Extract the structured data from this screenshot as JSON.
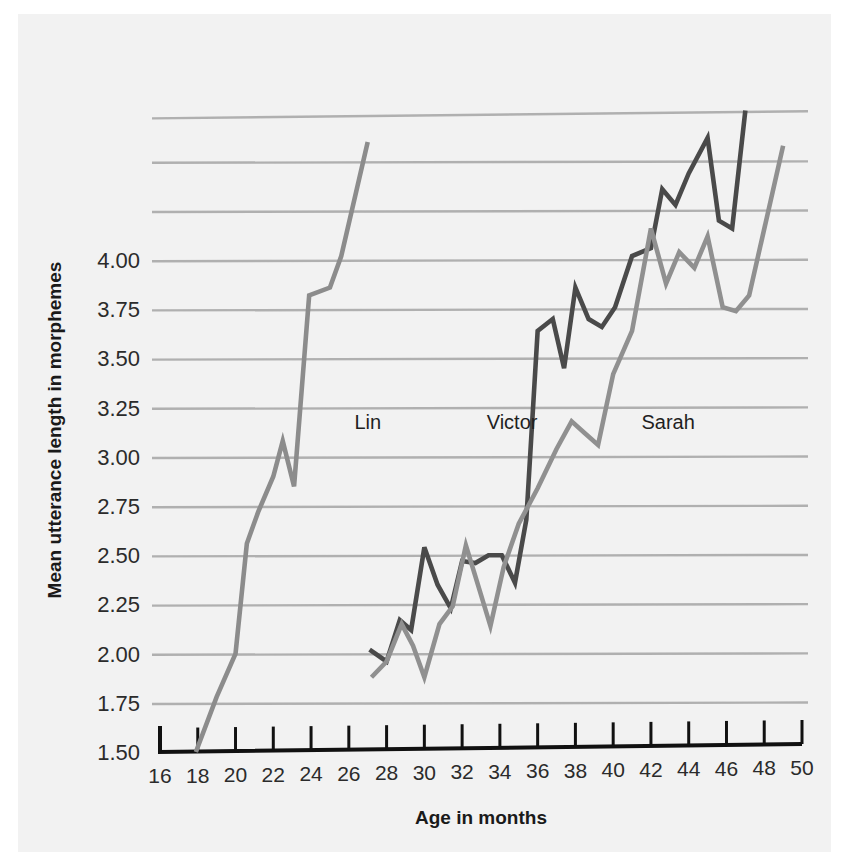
{
  "figure": {
    "background_color": "#f2f2f2",
    "page_color": "#ffffff"
  },
  "chart_data": {
    "type": "line",
    "title": "",
    "xlabel": "Age in months",
    "ylabel": "Mean utterance length in morphemes",
    "xlim": [
      16,
      50
    ],
    "ylim": [
      1.5,
      4.75
    ],
    "xticks": [
      16,
      18,
      20,
      22,
      24,
      26,
      28,
      30,
      32,
      34,
      36,
      38,
      40,
      42,
      44,
      46,
      48,
      50
    ],
    "xtick_labels": [
      "16",
      "18",
      "20",
      "22",
      "24",
      "26",
      "28",
      "30",
      "32",
      "34",
      "36",
      "38",
      "40",
      "42",
      "44",
      "46",
      "48",
      "50"
    ],
    "yticks": [
      1.5,
      1.75,
      2.0,
      2.25,
      2.5,
      2.75,
      3.0,
      3.25,
      3.5,
      3.75,
      4.0
    ],
    "ytick_labels": [
      "1.50",
      "1.75",
      "2.00",
      "2.25",
      "2.50",
      "2.75",
      "3.00",
      "3.25",
      "3.50",
      "3.75",
      "4.00"
    ],
    "grid": true,
    "grid_axis": "y",
    "grid_values": [
      1.75,
      2.0,
      2.25,
      2.5,
      2.75,
      3.0,
      3.25,
      3.5,
      3.75,
      4.0,
      4.25,
      4.5,
      4.75
    ],
    "legend": "inline-labels",
    "series": [
      {
        "name": "Lin",
        "color": "#8c8c8c",
        "label_x": 26.3,
        "label_y": 3.14,
        "points": [
          [
            17.9,
            1.5
          ],
          [
            19.0,
            1.78
          ],
          [
            20.0,
            2.0
          ],
          [
            20.6,
            2.56
          ],
          [
            21.2,
            2.72
          ],
          [
            22.0,
            2.9
          ],
          [
            22.5,
            3.08
          ],
          [
            23.1,
            2.85
          ],
          [
            23.9,
            3.82
          ],
          [
            25.0,
            3.86
          ],
          [
            25.6,
            4.02
          ],
          [
            27.0,
            4.6
          ]
        ]
      },
      {
        "name": "Victor",
        "color": "#4a4a4a",
        "label_x": 33.3,
        "label_y": 3.14,
        "points": [
          [
            27.1,
            2.02
          ],
          [
            28.0,
            1.96
          ],
          [
            28.7,
            2.17
          ],
          [
            29.3,
            2.12
          ],
          [
            30.0,
            2.54
          ],
          [
            30.7,
            2.35
          ],
          [
            31.4,
            2.23
          ],
          [
            32.0,
            2.47
          ],
          [
            32.7,
            2.46
          ],
          [
            33.4,
            2.5
          ],
          [
            34.1,
            2.5
          ],
          [
            34.8,
            2.36
          ],
          [
            35.4,
            2.68
          ],
          [
            36.0,
            3.64
          ],
          [
            36.8,
            3.7
          ],
          [
            37.4,
            3.45
          ],
          [
            38.0,
            3.86
          ],
          [
            38.7,
            3.7
          ],
          [
            39.4,
            3.66
          ],
          [
            40.1,
            3.76
          ],
          [
            41.0,
            4.02
          ],
          [
            42.0,
            4.06
          ],
          [
            42.6,
            4.36
          ],
          [
            43.3,
            4.28
          ],
          [
            44.0,
            4.44
          ],
          [
            45.0,
            4.62
          ],
          [
            45.6,
            4.2
          ],
          [
            46.3,
            4.16
          ],
          [
            47.0,
            4.76
          ]
        ]
      },
      {
        "name": "Sarah",
        "color": "#909090",
        "label_x": 41.5,
        "label_y": 3.14,
        "points": [
          [
            27.2,
            1.88
          ],
          [
            28.0,
            1.96
          ],
          [
            28.8,
            2.15
          ],
          [
            29.4,
            2.04
          ],
          [
            30.0,
            1.88
          ],
          [
            30.8,
            2.15
          ],
          [
            31.5,
            2.24
          ],
          [
            32.2,
            2.55
          ],
          [
            32.9,
            2.33
          ],
          [
            33.5,
            2.14
          ],
          [
            34.2,
            2.44
          ],
          [
            35.0,
            2.66
          ],
          [
            36.0,
            2.84
          ],
          [
            37.0,
            3.04
          ],
          [
            37.8,
            3.18
          ],
          [
            38.5,
            3.12
          ],
          [
            39.2,
            3.06
          ],
          [
            40.0,
            3.42
          ],
          [
            41.0,
            3.64
          ],
          [
            42.0,
            4.16
          ],
          [
            42.8,
            3.88
          ],
          [
            43.5,
            4.04
          ],
          [
            44.3,
            3.96
          ],
          [
            45.0,
            4.12
          ],
          [
            45.8,
            3.76
          ],
          [
            46.5,
            3.74
          ],
          [
            47.2,
            3.82
          ],
          [
            49.0,
            4.58
          ]
        ]
      }
    ]
  }
}
